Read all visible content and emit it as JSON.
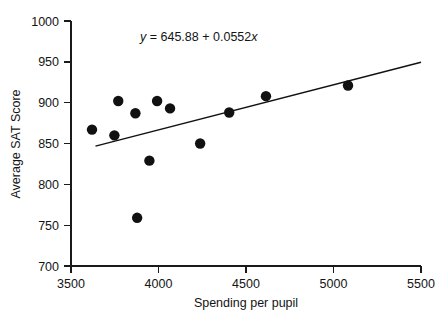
{
  "chart_data": {
    "type": "scatter",
    "title": "",
    "xlabel": "Spending per pupil",
    "ylabel": "Average SAT Score",
    "xlim": [
      3500,
      5500
    ],
    "ylim": [
      700,
      1000
    ],
    "xticks": [
      3500,
      4000,
      4500,
      5000,
      5500
    ],
    "yticks": [
      700,
      750,
      800,
      850,
      900,
      950,
      1000
    ],
    "xtick_labels": [
      "3500",
      "4000",
      "4500",
      "5000",
      "5500"
    ],
    "ytick_labels": [
      "700",
      "750",
      "800",
      "850",
      "900",
      "950",
      "1000"
    ],
    "grid": false,
    "legend": "none",
    "marker": {
      "shape": "circle",
      "color": "#111111",
      "size_px": 5.2
    },
    "points": [
      {
        "x": 3620,
        "y": 867
      },
      {
        "x": 3748,
        "y": 860
      },
      {
        "x": 3770,
        "y": 902
      },
      {
        "x": 3868,
        "y": 887
      },
      {
        "x": 3878,
        "y": 759
      },
      {
        "x": 3948,
        "y": 829
      },
      {
        "x": 3992,
        "y": 902
      },
      {
        "x": 4066,
        "y": 893
      },
      {
        "x": 4238,
        "y": 850
      },
      {
        "x": 4404,
        "y": 888
      },
      {
        "x": 4614,
        "y": 908
      },
      {
        "x": 5083,
        "y": 921
      }
    ],
    "regression": {
      "intercept": 645.88,
      "slope": 0.0552,
      "equation_label": "y = 645.88 + 0.0552x",
      "equation_parts": {
        "y_symbol": "y",
        "equals": " = ",
        "intercept_text": "645.88",
        "plus": " + ",
        "slope_text": "0.0552",
        "x_symbol": "x"
      },
      "line_color": "#111111",
      "x_start": 3640,
      "x_end": 5500,
      "annotation_position": {
        "x": 4230,
        "y": 975
      }
    }
  },
  "figure": {
    "background_color": "#ffffff",
    "axis_color": "#1a1a1a"
  }
}
